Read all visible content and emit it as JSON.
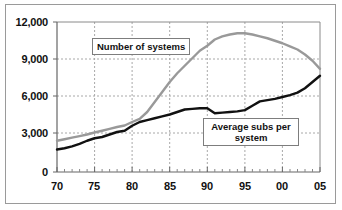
{
  "chart_data": {
    "type": "line",
    "title": "",
    "subtitle": "",
    "xlabel": "",
    "ylabel": "",
    "xlim": [
      70,
      105
    ],
    "ylim": [
      0,
      12000
    ],
    "ytick_labels": [
      "12,000",
      "9,000",
      "6,000",
      "3,000",
      "0"
    ],
    "ytick_values": [
      12000,
      9000,
      6000,
      3000,
      0
    ],
    "xtick_labels": [
      "70",
      "75",
      "80",
      "85",
      "90",
      "95",
      "00",
      "05"
    ],
    "xtick_values": [
      70,
      75,
      80,
      85,
      90,
      95,
      100,
      105
    ],
    "grid": true,
    "grid_style": "dotted",
    "legend_position": "inline-callouts",
    "x": [
      70,
      71,
      72,
      73,
      74,
      75,
      76,
      77,
      78,
      79,
      80,
      81,
      82,
      83,
      84,
      85,
      86,
      87,
      88,
      89,
      90,
      91,
      92,
      93,
      94,
      95,
      96,
      97,
      98,
      99,
      100,
      101,
      102,
      103,
      104,
      105
    ],
    "series": [
      {
        "name": "Number of systems",
        "color": "#999999",
        "values": [
          2500,
          2620,
          2750,
          2870,
          3000,
          3160,
          3300,
          3450,
          3600,
          3720,
          4000,
          4250,
          4800,
          5600,
          6400,
          7200,
          7900,
          8500,
          9100,
          9700,
          10100,
          10600,
          10850,
          11000,
          11100,
          11100,
          11000,
          10850,
          10700,
          10500,
          10300,
          10050,
          9800,
          9400,
          8900,
          8250
        ]
      },
      {
        "name": "Average subs per system",
        "color": "#111111",
        "values": [
          1800,
          1900,
          2050,
          2250,
          2500,
          2700,
          2800,
          3000,
          3200,
          3300,
          3700,
          4000,
          4150,
          4300,
          4450,
          4600,
          4800,
          5000,
          5050,
          5100,
          5100,
          4700,
          4750,
          4800,
          4850,
          4950,
          5300,
          5650,
          5750,
          5850,
          6000,
          6150,
          6350,
          6700,
          7200,
          7700
        ]
      }
    ],
    "annotations": [
      {
        "id": "callout-systems",
        "text": "Number of systems",
        "series": "Number of systems"
      },
      {
        "id": "callout-subs",
        "text": "Average subs per system",
        "series": "Average subs per system"
      }
    ]
  },
  "axes": {
    "y_labels": [
      "12,000",
      "9,000",
      "6,000",
      "3,000",
      "0"
    ],
    "x_labels": [
      "70",
      "75",
      "80",
      "85",
      "90",
      "95",
      "00",
      "05"
    ]
  },
  "callouts": {
    "systems": "Number of systems",
    "subs": "Average subs per system"
  },
  "colors": {
    "systems_line": "#999999",
    "subs_line": "#111111",
    "grid": "#a8a8a8",
    "axis": "#555555",
    "border": "#9a9a9a",
    "background": "#ffffff"
  }
}
